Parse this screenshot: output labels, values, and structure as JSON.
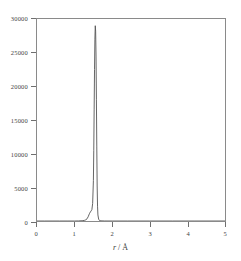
{
  "chart_data": {
    "type": "line",
    "title": "",
    "xlabel": "r / Å",
    "ylabel": "",
    "xlim": [
      0,
      5
    ],
    "ylim": [
      0,
      30000
    ],
    "grid": false,
    "legend": null,
    "xticks": [
      "0",
      "1",
      "2",
      "3",
      "4",
      "5"
    ],
    "xtick_values": [
      0,
      1,
      2,
      3,
      4,
      5
    ],
    "yticks": [
      "0",
      "5000",
      "10000",
      "15000",
      "20000",
      "25000",
      "30000"
    ],
    "ytick_values": [
      0,
      5000,
      10000,
      15000,
      20000,
      25000,
      30000
    ],
    "line_color": "#555555",
    "series": [
      {
        "name": "g(r)",
        "peak_center": 1.55,
        "peak_height": 29000,
        "x": [
          0.0,
          0.2,
          0.4,
          0.6,
          0.8,
          1.0,
          1.1,
          1.2,
          1.26,
          1.3,
          1.33,
          1.36,
          1.38,
          1.4,
          1.42,
          1.44,
          1.46,
          1.48,
          1.5,
          1.51,
          1.52,
          1.53,
          1.54,
          1.55,
          1.56,
          1.57,
          1.58,
          1.59,
          1.6,
          1.61,
          1.62,
          1.64,
          1.66,
          1.7,
          1.8,
          2.0,
          2.4,
          3.0,
          3.6,
          4.2,
          4.6,
          5.0
        ],
        "y": [
          0,
          0,
          0,
          0,
          0,
          0,
          10,
          40,
          90,
          180,
          320,
          620,
          900,
          1150,
          1350,
          1500,
          1700,
          2600,
          6000,
          10500,
          16500,
          22500,
          27000,
          29000,
          28200,
          24500,
          18000,
          11000,
          5200,
          2200,
          900,
          260,
          90,
          25,
          5,
          0,
          0,
          0,
          0,
          0,
          0,
          0
        ]
      }
    ]
  },
  "axes": {
    "x_title_italic": "r",
    "x_title_rest": " / Å"
  }
}
